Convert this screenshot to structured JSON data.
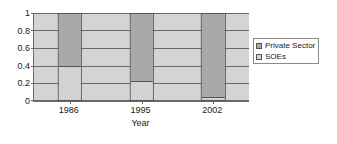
{
  "chart_data": {
    "type": "bar",
    "subtype": "stacked-100",
    "title": "",
    "xlabel": "Year",
    "ylabel": "",
    "categories": [
      "1986",
      "1995",
      "2002"
    ],
    "series": [
      {
        "name": "Private Sector",
        "values": [
          0.6,
          0.78,
          0.96
        ],
        "color": "#a9a9a9"
      },
      {
        "name": "SOEs",
        "values": [
          0.4,
          0.22,
          0.04
        ],
        "color": "#d2d2d2"
      }
    ],
    "ylim": [
      0,
      1
    ],
    "yticks": [
      "0",
      "0.2",
      "0.4",
      "0.6",
      "0.8",
      "1"
    ],
    "ytick_values": [
      0,
      0.2,
      0.4,
      0.6,
      0.8,
      1
    ],
    "grid": true,
    "legend_position": "right",
    "plot_background": "#d4d4d4",
    "axis_color": "#6a6a6a"
  },
  "legend": {
    "entries": [
      {
        "label": "Private Sector"
      },
      {
        "label": "SOEs"
      }
    ]
  }
}
